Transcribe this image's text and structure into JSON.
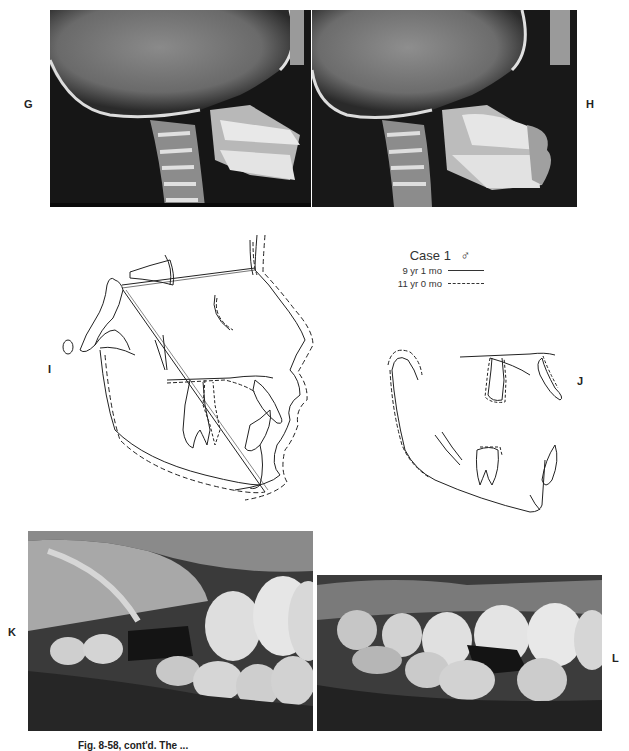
{
  "figure": {
    "panels": [
      {
        "label": "G",
        "type": "lateral-cephalometric-radiograph"
      },
      {
        "label": "H",
        "type": "lateral-cephalometric-radiograph"
      },
      {
        "label": "I",
        "type": "cephalometric-tracing-superimposition"
      },
      {
        "label": "J",
        "type": "mandibular-maxillary-tracing-superimposition"
      },
      {
        "label": "K",
        "type": "intraoral-photograph"
      },
      {
        "label": "L",
        "type": "intraoral-photograph"
      }
    ],
    "legend": {
      "title": "Case 1",
      "sex_symbol": "♂",
      "entries": [
        {
          "label": "9 yr 1 mo",
          "style": "solid"
        },
        {
          "label": "11 yr 0 mo",
          "style": "dashed"
        }
      ]
    },
    "caption": "Fig. 8-58, cont'd. The ..."
  }
}
